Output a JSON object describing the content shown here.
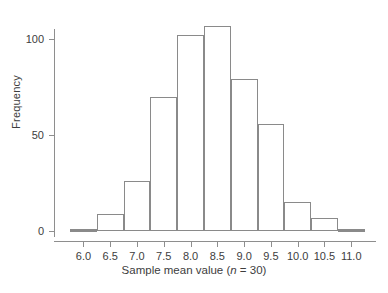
{
  "chart_data": {
    "type": "bar",
    "title": "",
    "subtitle": "",
    "xlabel": "Sample mean value (n = 30)",
    "xlabel_prefix": "Sample mean value (",
    "xlabel_italic": "n",
    "xlabel_suffix": " = 30)",
    "ylabel": "Frequency",
    "grid": false,
    "legend": "none",
    "xlim": [
      5.6,
      11.35
    ],
    "ylim": [
      0,
      112
    ],
    "bin_width": 0.5,
    "bin_edges": [
      5.75,
      6.25,
      6.75,
      7.25,
      7.75,
      8.25,
      8.75,
      9.25,
      9.75,
      10.25,
      10.75,
      11.25
    ],
    "categories": [
      "5.75-6.25",
      "6.25-6.75",
      "6.75-7.25",
      "7.25-7.75",
      "7.75-8.25",
      "8.25-8.75",
      "8.75-9.25",
      "9.25-9.75",
      "9.75-10.25",
      "10.25-10.75",
      "10.75-11.25"
    ],
    "bin_centers": [
      6.0,
      6.5,
      7.0,
      7.5,
      8.0,
      8.5,
      9.0,
      9.5,
      10.0,
      10.5,
      11.0
    ],
    "values": [
      1,
      9,
      26,
      70,
      102,
      107,
      79,
      56,
      15,
      7,
      1
    ],
    "xticks": [
      "6.0",
      "6.5",
      "7.0",
      "7.5",
      "8.0",
      "8.5",
      "9.0",
      "9.5",
      "10.0",
      "10.5",
      "11.0"
    ],
    "xtick_values": [
      6.0,
      6.5,
      7.0,
      7.5,
      8.0,
      8.5,
      9.0,
      9.5,
      10.0,
      10.5,
      11.0
    ],
    "yticks": [
      "0",
      "50",
      "100"
    ],
    "ytick_values": [
      0,
      50,
      100
    ],
    "colors": {
      "bar_edge": "#8a8a8a",
      "bar_fill": "#ffffff",
      "axis": "#8e8e8e",
      "text": "#3d3d3d",
      "background": "#ffffff"
    }
  }
}
